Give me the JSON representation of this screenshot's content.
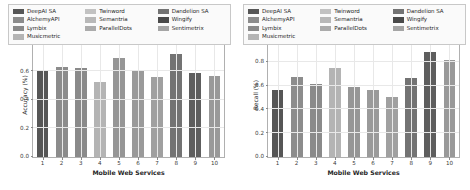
{
  "chart_data": [
    {
      "type": "bar",
      "title": "",
      "xlabel": "Mobile Web Services",
      "ylabel": "Accuracy (%)",
      "categories": [
        "1",
        "2",
        "3",
        "4",
        "5",
        "6",
        "7",
        "8",
        "9",
        "10"
      ],
      "values": [
        0.61,
        0.63,
        0.62,
        0.525,
        0.69,
        0.61,
        0.56,
        0.72,
        0.59,
        0.57
      ],
      "series_names": [
        "DeepAI SA",
        "AlchemyAPI",
        "Lymbix",
        "Musicmetric",
        "Twinword",
        "Semantria",
        "ParallelDots",
        "Dandelion SA",
        "Wingify",
        "Sentimetrix"
      ],
      "bar_colors": [
        "#565656",
        "#8c8c8c",
        "#8a8a8a",
        "#b4b4b4",
        "#969696",
        "#9a9a9a",
        "#a0a0a0",
        "#737373",
        "#5e5e5e",
        "#999999"
      ],
      "ylim": [
        0.0,
        1.0
      ],
      "yticks": [
        "0.0",
        "0.2",
        "0.4",
        "0.6",
        "0.8",
        "1.0"
      ],
      "ytick_values": [
        0.0,
        0.2,
        0.4,
        0.6,
        0.8,
        1.0
      ],
      "grid": true,
      "legend_position": "upper center"
    },
    {
      "type": "bar",
      "title": "",
      "xlabel": "Mobile Web Services",
      "ylabel": "Recall (%)",
      "categories": [
        "1",
        "2",
        "3",
        "4",
        "5",
        "6",
        "7",
        "8",
        "9",
        "10"
      ],
      "values": [
        0.56,
        0.67,
        0.61,
        0.745,
        0.585,
        0.565,
        0.5,
        0.665,
        0.88,
        0.81
      ],
      "series_names": [
        "DeepAI SA",
        "AlchemyAPI",
        "Lymbix",
        "Musicmetric",
        "Twinword",
        "Semantria",
        "ParallelDots",
        "Dandelion SA",
        "Wingify",
        "Sentimetrix"
      ],
      "bar_colors": [
        "#565656",
        "#8c8c8c",
        "#8a8a8a",
        "#b4b4b4",
        "#969696",
        "#9a9a9a",
        "#a0a0a0",
        "#737373",
        "#5e5e5e",
        "#999999"
      ],
      "ylim": [
        0.0,
        1.2
      ],
      "yticks": [
        "0.0",
        "0.2",
        "0.4",
        "0.6",
        "0.8",
        "1.0",
        "1.2"
      ],
      "ytick_values": [
        0.0,
        0.2,
        0.4,
        0.6,
        0.8,
        1.0,
        1.2
      ],
      "grid": true,
      "legend_position": "upper center"
    }
  ],
  "legend": {
    "columns": [
      [
        {
          "label": "DeepAI SA",
          "color": "#565656"
        },
        {
          "label": "AlchemyAPI",
          "color": "#8c8c8c"
        },
        {
          "label": "Lymbix",
          "color": "#8a8a8a"
        },
        {
          "label": "Musicmetric",
          "color": "#b4b4b4"
        }
      ],
      [
        {
          "label": "Twinword",
          "color": "#c2c2c2"
        },
        {
          "label": "Semantria",
          "color": "#b8b8b8"
        },
        {
          "label": "ParallelDots",
          "color": "#ababab"
        }
      ],
      [
        {
          "label": "Dandelion SA",
          "color": "#737373"
        },
        {
          "label": "Wingify",
          "color": "#4a4a4a"
        },
        {
          "label": "Sentimetrix",
          "color": "#a5a5a5"
        }
      ]
    ]
  }
}
